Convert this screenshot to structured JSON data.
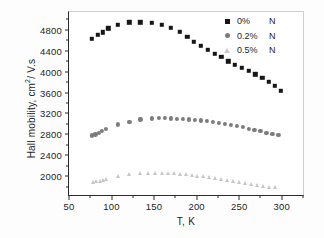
{
  "chart_data": {
    "type": "scatter",
    "title": "",
    "xlabel": "T, K",
    "ylabel": "Hall mobility, cm2/ V.s",
    "ylabel_base": "Hall mobility, cm",
    "ylabel_sup": "2",
    "ylabel_tail": "/ V.s",
    "xlim": [
      50,
      325
    ],
    "ylim": [
      1640,
      5140
    ],
    "xticks": [
      50,
      100,
      150,
      200,
      250,
      300
    ],
    "yticks": [
      2000,
      2400,
      2800,
      3200,
      3600,
      4000,
      4400,
      4800
    ],
    "grid": false,
    "legend_position": "top-right",
    "colors": {
      "series_0pct": "#161616",
      "series_02pct": "#7c7c7c",
      "series_05pct": "#c6c6c6",
      "axis": "#2b2b2b",
      "background": "#ffffff"
    },
    "series": [
      {
        "name": "0%   N",
        "label_pct": "0%",
        "label_element": "N",
        "marker": "square",
        "color": "#161616",
        "x": [
          77,
          84,
          90,
          96,
          107,
          121,
          134,
          147,
          159,
          170,
          180,
          189,
          197,
          205,
          213,
          221,
          229,
          237,
          245,
          253,
          261,
          269,
          277,
          285,
          292,
          299
        ],
        "y": [
          4625,
          4700,
          4755,
          4825,
          4900,
          4940,
          4945,
          4935,
          4895,
          4840,
          4760,
          4660,
          4570,
          4490,
          4420,
          4340,
          4285,
          4200,
          4135,
          4075,
          4015,
          3950,
          3885,
          3810,
          3730,
          3635
        ]
      },
      {
        "name": "0.2% N",
        "label_pct": "0.2%",
        "label_element": "N",
        "marker": "circle",
        "color": "#7c7c7c",
        "x": [
          77,
          81,
          85,
          89,
          93,
          107,
          121,
          134,
          147,
          156,
          163,
          170,
          177,
          184,
          191,
          198,
          205,
          212,
          219,
          226,
          233,
          240,
          247,
          254,
          261,
          268,
          275,
          282,
          289,
          296
        ],
        "y": [
          2780,
          2800,
          2830,
          2870,
          2905,
          2990,
          3045,
          3085,
          3105,
          3115,
          3110,
          3105,
          3100,
          3095,
          3085,
          3075,
          3065,
          3050,
          3035,
          3020,
          3000,
          2980,
          2960,
          2935,
          2910,
          2885,
          2860,
          2835,
          2815,
          2790
        ]
      },
      {
        "name": "0.5% N",
        "label_pct": "0.5%",
        "label_element": "N",
        "marker": "triangle",
        "color": "#c6c6c6",
        "x": [
          78,
          82,
          86,
          90,
          94,
          107,
          121,
          134,
          143,
          151,
          159,
          166,
          173,
          180,
          187,
          194,
          201,
          208,
          215,
          222,
          229,
          236,
          243,
          250,
          257,
          264,
          271,
          278,
          285,
          292
        ],
        "y": [
          1885,
          1900,
          1915,
          1935,
          1955,
          2000,
          2040,
          2055,
          2065,
          2070,
          2070,
          2065,
          2055,
          2045,
          2035,
          2025,
          2010,
          1995,
          1980,
          1965,
          1950,
          1935,
          1915,
          1895,
          1875,
          1855,
          1835,
          1815,
          1800,
          1790
        ]
      }
    ]
  }
}
